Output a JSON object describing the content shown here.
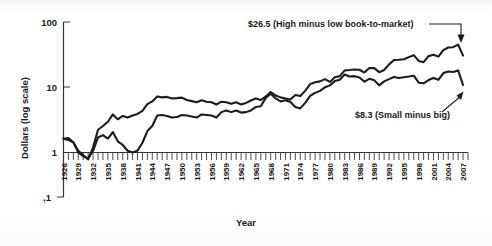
{
  "figure": {
    "axis_title_x": "Year",
    "axis_title_y": "Dollars (log scale)"
  },
  "annotations": {
    "high_low": "$26.5 (High minus low book-to-market)",
    "small_big": "$8.3 (Small minus big)"
  },
  "colors": {
    "line": "#1c1c1c",
    "axis": "#333333",
    "background": "#ffffff"
  },
  "chart_data": {
    "type": "line",
    "title": "",
    "subtitle": "",
    "xlabel": "Year",
    "ylabel": "Dollars (log scale)",
    "yscale": "log",
    "ylim": [
      0.1,
      100
    ],
    "xlim": [
      1926,
      2008
    ],
    "grid": false,
    "legend_position": "annotations-inline",
    "ytick_labels": [
      "100",
      "10",
      "1",
      ",1"
    ],
    "ytick_values": [
      100,
      10,
      1,
      0.1
    ],
    "xtick_labels": [
      "1926",
      "1929",
      "1932",
      "1935",
      "1938",
      "1941",
      "1944",
      "1947",
      "1950",
      "1953",
      "1956",
      "1959",
      "1962",
      "1965",
      "1968",
      "1971",
      "1974",
      "1977",
      "1980",
      "1983",
      "1986",
      "1989",
      "1992",
      "1995",
      "1998",
      "2001",
      "2004",
      "2007"
    ],
    "xtick_values": [
      1926,
      1929,
      1932,
      1935,
      1938,
      1941,
      1944,
      1947,
      1950,
      1953,
      1956,
      1959,
      1962,
      1965,
      1968,
      1971,
      1974,
      1977,
      1980,
      1983,
      1986,
      1989,
      1992,
      1995,
      1998,
      2001,
      2004,
      2007
    ],
    "x": [
      1926,
      1927,
      1928,
      1929,
      1930,
      1931,
      1932,
      1933,
      1934,
      1935,
      1936,
      1937,
      1938,
      1939,
      1940,
      1941,
      1942,
      1943,
      1944,
      1945,
      1946,
      1947,
      1948,
      1949,
      1950,
      1951,
      1952,
      1953,
      1954,
      1955,
      1956,
      1957,
      1958,
      1959,
      1960,
      1961,
      1962,
      1963,
      1964,
      1965,
      1966,
      1967,
      1968,
      1969,
      1970,
      1971,
      1972,
      1973,
      1974,
      1975,
      1976,
      1977,
      1978,
      1979,
      1980,
      1981,
      1982,
      1983,
      1984,
      1985,
      1986,
      1987,
      1988,
      1989,
      1990,
      1991,
      1992,
      1993,
      1994,
      1995,
      1996,
      1997,
      1998,
      1999,
      2000,
      2001,
      2002,
      2003,
      2004,
      2005,
      2006,
      2007
    ],
    "series": [
      {
        "name": "High minus low book-to-market",
        "end_value": 26.5,
        "end_label": "$26.5 (High minus low book-to-market)",
        "values": [
          1.0,
          1.02,
          0.86,
          0.62,
          0.52,
          0.44,
          0.71,
          1.42,
          1.65,
          1.95,
          2.6,
          2.15,
          2.45,
          2.3,
          2.5,
          2.65,
          3.0,
          3.9,
          4.35,
          5.3,
          5.1,
          5.2,
          4.9,
          4.95,
          5.05,
          4.6,
          4.4,
          4.2,
          4.55,
          4.3,
          4.2,
          3.85,
          4.3,
          4.2,
          3.95,
          4.2,
          3.85,
          4.1,
          4.5,
          4.9,
          4.6,
          5.3,
          6.3,
          5.5,
          5.1,
          4.9,
          4.7,
          5.6,
          5.4,
          6.6,
          8.6,
          9.3,
          9.6,
          10.5,
          9.4,
          11.3,
          11.8,
          14.8,
          15.0,
          15.3,
          15.2,
          13.6,
          16.3,
          16.2,
          13.8,
          15.0,
          18.8,
          22.3,
          22.6,
          23.0,
          25.0,
          27.0,
          21.5,
          20.5,
          26.0,
          27.5,
          25.5,
          33.0,
          36.5,
          37.0,
          41.0,
          26.5
        ]
      },
      {
        "name": "Small minus big",
        "end_value": 8.3,
        "end_label": "$8.3 (Small minus big)",
        "values": [
          1.0,
          0.95,
          0.87,
          0.58,
          0.5,
          0.46,
          0.62,
          1.05,
          1.15,
          1.0,
          1.3,
          0.9,
          0.78,
          0.62,
          0.58,
          0.62,
          0.85,
          1.35,
          1.65,
          2.5,
          2.55,
          2.45,
          2.3,
          2.35,
          2.55,
          2.5,
          2.4,
          2.3,
          2.6,
          2.55,
          2.5,
          2.3,
          2.85,
          3.05,
          2.85,
          3.05,
          2.8,
          2.85,
          3.05,
          3.5,
          3.6,
          5.0,
          5.9,
          4.9,
          4.35,
          4.55,
          4.25,
          3.5,
          3.3,
          4.1,
          5.4,
          6.1,
          6.6,
          7.6,
          8.2,
          9.7,
          10.2,
          12.6,
          11.6,
          11.8,
          11.2,
          9.5,
          10.6,
          10.0,
          8.2,
          9.6,
          10.5,
          11.4,
          11.0,
          11.3,
          11.6,
          12.0,
          9.1,
          8.9,
          10.1,
          11.0,
          10.2,
          13.3,
          14.2,
          13.9,
          14.8,
          8.3
        ]
      }
    ]
  }
}
